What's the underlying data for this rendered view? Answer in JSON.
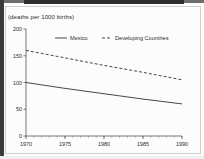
{
  "figure": {
    "units_label": "(deaths per 1000 births)"
  },
  "chart_data": {
    "type": "line",
    "title": "",
    "subtitle": "",
    "xlabel": "",
    "ylabel": "(deaths per 1000 births)",
    "xlim": [
      1970,
      1990
    ],
    "ylim": [
      0,
      200
    ],
    "xticks": [
      1970,
      1975,
      1980,
      1985,
      1990
    ],
    "xtick_labels": [
      "1970",
      "1975",
      "1980",
      "1985",
      "1990"
    ],
    "yticks": [
      0,
      50,
      100,
      150,
      200
    ],
    "ytick_labels": [
      "0",
      "50",
      "100",
      "150",
      "200"
    ],
    "minor_xticks": true,
    "grid": false,
    "legend_position": "top-center",
    "x": [
      1970,
      1975,
      1980,
      1985,
      1990
    ],
    "series": [
      {
        "name": "Mexico",
        "style": "solid",
        "color": "#333333",
        "values": [
          100,
          89,
          79,
          69,
          60
        ]
      },
      {
        "name": "Developing Countries",
        "style": "dashed",
        "color": "#333333",
        "values": [
          160,
          146,
          132,
          119,
          105
        ]
      }
    ]
  }
}
